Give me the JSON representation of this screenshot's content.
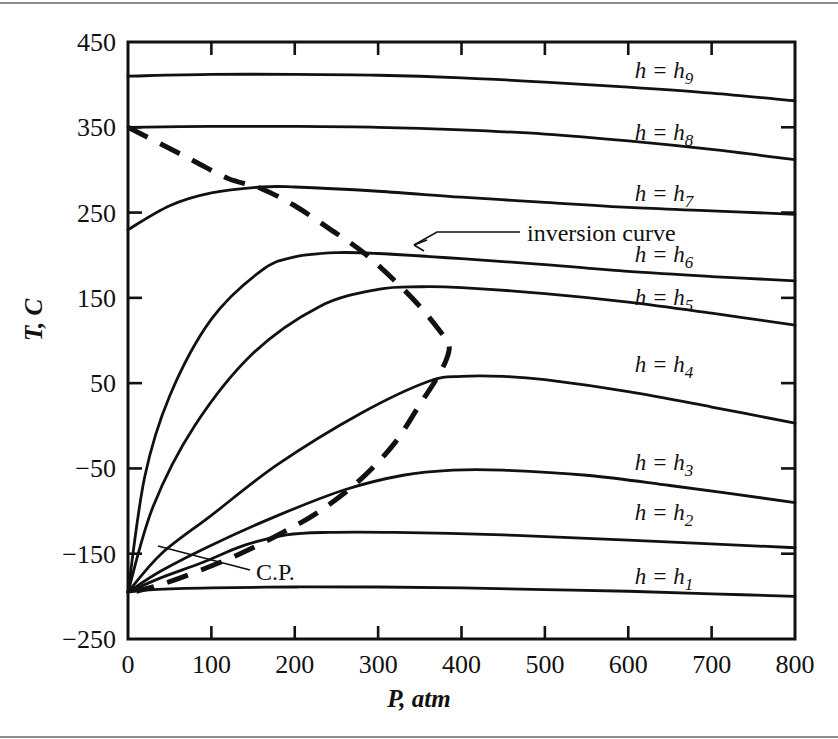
{
  "figure": {
    "kind": "isenthalp-diagram",
    "background": "#ffffff",
    "ink": "#111111"
  },
  "axes": {
    "x_label": "P, atm",
    "y_label": "T, C",
    "x_ticks": [
      "0",
      "100",
      "200",
      "300",
      "400",
      "500",
      "600",
      "700",
      "800"
    ],
    "y_ticks": [
      "450",
      "350",
      "250",
      "150",
      "50",
      "−50",
      "−150",
      "−250"
    ]
  },
  "annotations": {
    "inversion_curve": "inversion curve",
    "critical_point": "C.P."
  },
  "curve_labels": [
    {
      "eq": "h = h",
      "sub": "9"
    },
    {
      "eq": "h = h",
      "sub": "8"
    },
    {
      "eq": "h = h",
      "sub": "7"
    },
    {
      "eq": "h = h",
      "sub": "6"
    },
    {
      "eq": "h = h",
      "sub": "5"
    },
    {
      "eq": "h = h",
      "sub": "4"
    },
    {
      "eq": "h = h",
      "sub": "3"
    },
    {
      "eq": "h = h",
      "sub": "2"
    },
    {
      "eq": "h = h",
      "sub": "1"
    }
  ],
  "chart_data": {
    "type": "line",
    "title": "",
    "xlabel": "P, atm",
    "ylabel": "T, C",
    "xlim": [
      0,
      800
    ],
    "ylim": [
      -250,
      450
    ],
    "xtick_values": [
      0,
      100,
      200,
      300,
      400,
      500,
      600,
      700,
      800
    ],
    "ytick_values": [
      -250,
      -150,
      -50,
      50,
      150,
      250,
      350,
      450
    ],
    "grid": false,
    "legend": "inline-labels-on-curves",
    "series": [
      {
        "name": "h = h9",
        "style": "solid",
        "points": [
          [
            0,
            410
          ],
          [
            100,
            412
          ],
          [
            200,
            412
          ],
          [
            300,
            411
          ],
          [
            400,
            408
          ],
          [
            500,
            403
          ],
          [
            600,
            397
          ],
          [
            700,
            390
          ],
          [
            800,
            381
          ]
        ]
      },
      {
        "name": "h = h8",
        "style": "solid",
        "points": [
          [
            0,
            350
          ],
          [
            100,
            351
          ],
          [
            200,
            351
          ],
          [
            300,
            350
          ],
          [
            400,
            347
          ],
          [
            500,
            342
          ],
          [
            600,
            334
          ],
          [
            700,
            324
          ],
          [
            800,
            312
          ]
        ]
      },
      {
        "name": "h = h7",
        "style": "solid",
        "points": [
          [
            0,
            230
          ],
          [
            50,
            258
          ],
          [
            100,
            273
          ],
          [
            160,
            280
          ],
          [
            200,
            280
          ],
          [
            300,
            275
          ],
          [
            400,
            268
          ],
          [
            500,
            262
          ],
          [
            600,
            256
          ],
          [
            700,
            252
          ],
          [
            800,
            248
          ]
        ]
      },
      {
        "name": "h = h6",
        "style": "solid",
        "points": [
          [
            0,
            -195
          ],
          [
            20,
            -60
          ],
          [
            50,
            35
          ],
          [
            100,
            125
          ],
          [
            160,
            182
          ],
          [
            200,
            198
          ],
          [
            250,
            203
          ],
          [
            300,
            202
          ],
          [
            400,
            196
          ],
          [
            500,
            189
          ],
          [
            600,
            181
          ],
          [
            700,
            175
          ],
          [
            800,
            170
          ]
        ]
      },
      {
        "name": "h = h5",
        "style": "solid",
        "points": [
          [
            0,
            -195
          ],
          [
            30,
            -95
          ],
          [
            80,
            0
          ],
          [
            150,
            85
          ],
          [
            230,
            140
          ],
          [
            300,
            160
          ],
          [
            350,
            163
          ],
          [
            400,
            162
          ],
          [
            500,
            155
          ],
          [
            600,
            145
          ],
          [
            700,
            132
          ],
          [
            800,
            118
          ]
        ]
      },
      {
        "name": "h = h4",
        "style": "solid",
        "points": [
          [
            0,
            -195
          ],
          [
            40,
            -150
          ],
          [
            100,
            -105
          ],
          [
            180,
            -45
          ],
          [
            280,
            15
          ],
          [
            360,
            52
          ],
          [
            400,
            58
          ],
          [
            450,
            58
          ],
          [
            500,
            54
          ],
          [
            600,
            40
          ],
          [
            700,
            22
          ],
          [
            800,
            3
          ]
        ]
      },
      {
        "name": "h = h3",
        "style": "solid",
        "points": [
          [
            0,
            -195
          ],
          [
            40,
            -170
          ],
          [
            100,
            -140
          ],
          [
            180,
            -105
          ],
          [
            260,
            -75
          ],
          [
            330,
            -58
          ],
          [
            390,
            -52
          ],
          [
            450,
            -52
          ],
          [
            550,
            -58
          ],
          [
            650,
            -70
          ],
          [
            800,
            -90
          ]
        ]
      },
      {
        "name": "h = h2",
        "style": "solid",
        "points": [
          [
            0,
            -195
          ],
          [
            40,
            -178
          ],
          [
            90,
            -160
          ],
          [
            140,
            -140
          ],
          [
            190,
            -128
          ],
          [
            240,
            -125
          ],
          [
            320,
            -125
          ],
          [
            450,
            -128
          ],
          [
            600,
            -134
          ],
          [
            800,
            -143
          ]
        ]
      },
      {
        "name": "h = h1",
        "style": "solid",
        "points": [
          [
            0,
            -195
          ],
          [
            30,
            -192
          ],
          [
            100,
            -190
          ],
          [
            200,
            -189
          ],
          [
            300,
            -189
          ],
          [
            400,
            -190
          ],
          [
            500,
            -192
          ],
          [
            600,
            -194
          ],
          [
            700,
            -197
          ],
          [
            800,
            -200
          ]
        ]
      },
      {
        "name": "inversion curve",
        "style": "dashed",
        "points": [
          [
            0,
            350
          ],
          [
            40,
            330
          ],
          [
            80,
            310
          ],
          [
            120,
            290
          ],
          [
            160,
            278
          ],
          [
            200,
            258
          ],
          [
            240,
            232
          ],
          [
            280,
            205
          ],
          [
            320,
            170
          ],
          [
            350,
            140
          ],
          [
            375,
            110
          ],
          [
            385,
            95
          ],
          [
            382,
            78
          ],
          [
            370,
            55
          ],
          [
            350,
            25
          ],
          [
            320,
            -20
          ],
          [
            280,
            -62
          ],
          [
            230,
            -100
          ],
          [
            180,
            -128
          ],
          [
            130,
            -152
          ],
          [
            80,
            -172
          ],
          [
            40,
            -186
          ],
          [
            10,
            -194
          ]
        ]
      }
    ]
  }
}
